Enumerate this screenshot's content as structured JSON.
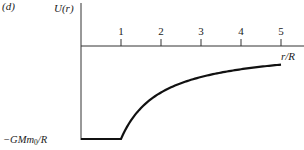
{
  "panel_label": "(d)",
  "chart_data": {
    "type": "line",
    "title": "",
    "panel": "(d)",
    "xlabel": "r/R",
    "ylabel": "U(r)",
    "x_ticks": [
      "1",
      "2",
      "3",
      "4",
      "5"
    ],
    "y_tick_labels": [
      "-GMm0/R"
    ],
    "xlim": [
      0,
      5.2
    ],
    "ylim": [
      -1,
      0.35
    ],
    "grid": false,
    "legend": null,
    "series": [
      {
        "name": "U(r)",
        "description": "Constant -GMm0/R for 0 <= r/R <= 1; -GMm0/r for r/R > 1",
        "x": [
          0,
          1,
          1.25,
          1.5,
          2,
          2.5,
          3,
          3.5,
          4,
          4.5,
          5
        ],
        "y": [
          -1,
          -1,
          -0.8,
          -0.667,
          -0.5,
          -0.4,
          -0.333,
          -0.286,
          -0.25,
          -0.222,
          -0.2
        ]
      }
    ]
  },
  "axis": {
    "y_label_main": "U",
    "y_label_arg": "(r)",
    "x_label": "r/R",
    "y_min_label_prefix": "−GMm",
    "y_min_label_sub": "0",
    "y_min_label_suffix": "/R"
  }
}
